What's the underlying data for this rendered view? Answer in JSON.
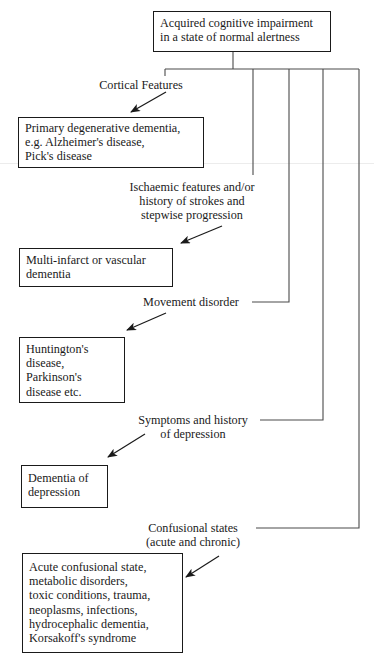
{
  "diagram": {
    "type": "flowchart",
    "root": {
      "lines": [
        "Acquired cognitive impairment",
        "in a state of normal alertness"
      ]
    },
    "branches": [
      {
        "condition": [
          "Cortical Features"
        ],
        "outcome": [
          "Primary degenerative dementia,",
          "e.g. Alzheimer's disease,",
          "Pick's disease"
        ]
      },
      {
        "condition": [
          "Ischaemic features and/or",
          "history of strokes and",
          "stepwise progression"
        ],
        "outcome": [
          "Multi-infarct or vascular",
          "dementia"
        ]
      },
      {
        "condition": [
          "Movement disorder"
        ],
        "outcome": [
          "Huntington's",
          "disease,",
          "Parkinson's",
          "disease etc."
        ]
      },
      {
        "condition": [
          "Symptoms and history",
          "of depression"
        ],
        "outcome": [
          "Dementia of",
          "depression"
        ]
      },
      {
        "condition": [
          "Confusional states",
          "(acute and chronic)"
        ],
        "outcome": [
          "Acute confusional state,",
          "metabolic disorders,",
          "toxic conditions, trauma,",
          "neoplasms, infections,",
          "hydrocephalic dementia,",
          "Korsakoff's syndrome"
        ]
      }
    ],
    "colors": {
      "line": "#1a1a1a",
      "connector": "#4a4a4a",
      "background": "#ffffff"
    }
  }
}
